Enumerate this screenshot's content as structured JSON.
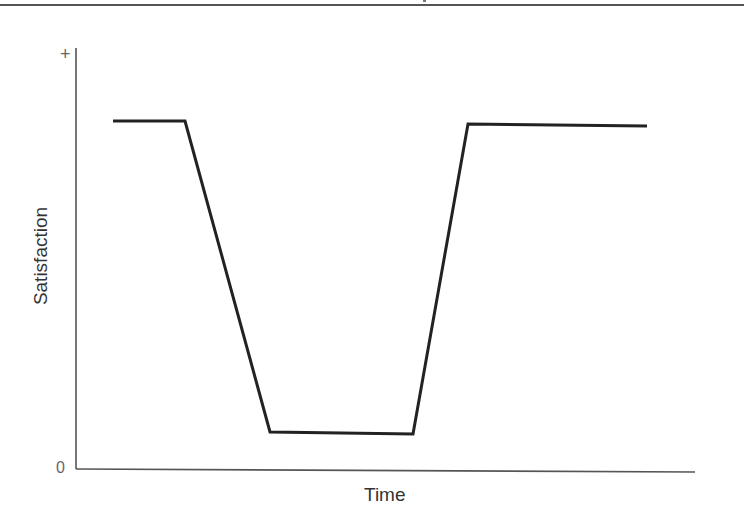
{
  "chart_data": {
    "type": "line",
    "title": "",
    "xlabel": "Time",
    "ylabel": "Satisfaction",
    "y_tick_labels": {
      "top": "+",
      "bottom": "0"
    },
    "grid": false,
    "legend": null,
    "series": [
      {
        "name": "Satisfaction over time",
        "color": "#222222",
        "points_normalized": [
          {
            "x": 0.06,
            "y": 0.88
          },
          {
            "x": 0.18,
            "y": 0.88
          },
          {
            "x": 0.32,
            "y": 0.1
          },
          {
            "x": 0.55,
            "y": 0.09
          },
          {
            "x": 0.64,
            "y": 0.87
          },
          {
            "x": 0.93,
            "y": 0.87
          }
        ],
        "points_px": [
          [
            113,
            121
          ],
          [
            185,
            121
          ],
          [
            270,
            432
          ],
          [
            413,
            434
          ],
          [
            468,
            124
          ],
          [
            647,
            126
          ]
        ]
      }
    ],
    "axis": {
      "origin_px": [
        76,
        469
      ],
      "x_end_px": 695,
      "y_top_px": 48,
      "color": "#555555"
    },
    "ylim": [
      0,
      1
    ],
    "xlim": [
      0,
      1
    ]
  },
  "labels": {
    "x_axis": "Time",
    "y_axis": "Satisfaction",
    "y_max": "+",
    "y_min": "0"
  }
}
